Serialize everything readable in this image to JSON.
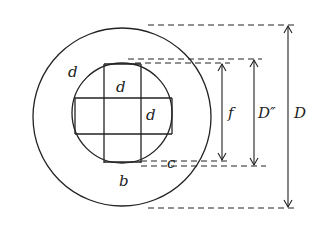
{
  "diagram": {
    "labels": {
      "outer_ring": "d",
      "inner_top": "d",
      "inner_right": "d",
      "bottom": "b",
      "corner": "c",
      "dim_f": "f",
      "dim_d_double": "D″",
      "dim_D": "D"
    },
    "colors": {
      "line": "#222222",
      "background": "#ffffff"
    }
  }
}
